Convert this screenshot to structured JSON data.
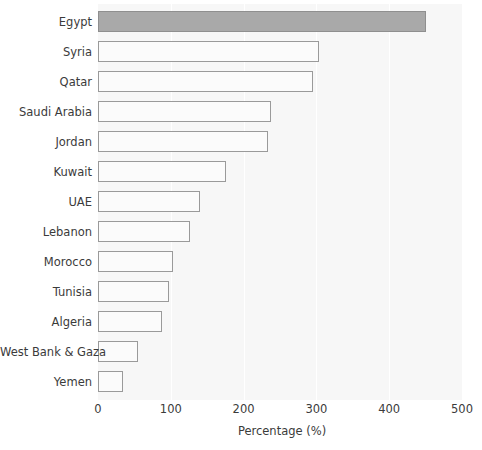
{
  "chart_data": {
    "type": "bar",
    "orientation": "horizontal",
    "title": "",
    "subtitle": "",
    "xlabel": "Percentage (%)",
    "ylabel": "",
    "xlim": [
      0,
      500
    ],
    "xticks": [
      0,
      100,
      200,
      300,
      400,
      500
    ],
    "xticklabels": [
      "0",
      "100",
      "200",
      "300",
      "400",
      "500"
    ],
    "grid": true,
    "grid_axis": "x",
    "legend": false,
    "legend_position": "none",
    "categories": [
      "Egypt",
      "Syria",
      "Qatar",
      "Saudi Arabia",
      "Jordan",
      "Kuwait",
      "UAE",
      "Lebanon",
      "Morocco",
      "Tunisia",
      "Algeria",
      "West Bank & Gaza",
      "Yemen"
    ],
    "values": [
      450,
      303,
      295,
      238,
      233,
      176,
      140,
      126,
      103,
      98,
      88,
      55,
      34
    ],
    "highlight_index": 0,
    "colors": {
      "plot_background": "#f7f7f7",
      "page_background": "#ffffff",
      "gridline": "#ffffff",
      "bar_fill": "#fbfbfb",
      "bar_border": "#9a9a9a",
      "highlight_fill": "#a9a9a9",
      "highlight_border": "#8f8f8f",
      "text": "#3b3b3b"
    }
  }
}
